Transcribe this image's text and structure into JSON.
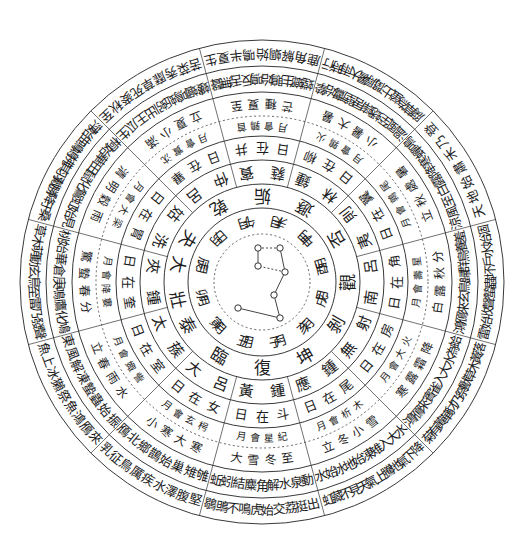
{
  "diagram": {
    "title": "",
    "center": {
      "name": "big-dipper",
      "stars": [
        {
          "x": 258,
          "y": 248
        },
        {
          "x": 280,
          "y": 248
        },
        {
          "x": 285,
          "y": 272
        },
        {
          "x": 258,
          "y": 266
        },
        {
          "x": 274,
          "y": 295
        },
        {
          "x": 280,
          "y": 318
        },
        {
          "x": 238,
          "y": 308
        }
      ]
    },
    "rings": [
      {
        "name": "months",
        "radius": 62,
        "font_size": 13,
        "items": [
          "月子",
          "月丑",
          "月寅",
          "月卯",
          "月辰",
          "月巳",
          "月午",
          "月未",
          "月申",
          "月酉",
          "月戌",
          "月亥"
        ]
      },
      {
        "name": "hexagrams",
        "radius": 86,
        "font_size": 17,
        "items": [
          "復",
          "臨",
          "泰",
          "大壯",
          "夬",
          "乾",
          "姤",
          "遯",
          "否",
          "觀",
          "剝",
          "坤"
        ]
      },
      {
        "name": "pitch-pipes",
        "radius": 110,
        "font_size": 15,
        "items": [
          "黃鍾",
          "大呂",
          "太蔟",
          "夾鍾",
          "姑洗",
          "仲呂",
          "蕤賓",
          "林鍾",
          "夷則",
          "南呂",
          "無射",
          "應鍾"
        ]
      },
      {
        "name": "sun-lodges",
        "radius": 134,
        "font_size": 13,
        "items": [
          "日在斗",
          "日在女",
          "日在室",
          "日在奎",
          "日在胃",
          "日在畢",
          "日在井",
          "日在柳",
          "日在翼",
          "日在角",
          "日在房",
          "日在尾"
        ]
      },
      {
        "name": "lunar-meetings",
        "radius": 156,
        "font_size": 10,
        "items": [
          "月會星紀",
          "月會玄枵",
          "月會娵訾",
          "月會降婁",
          "月會大梁",
          "月會實沈",
          "月會鶉首",
          "月會鶉火",
          "月會鶉尾",
          "月會壽星",
          "月會大火",
          "月會析木"
        ]
      },
      {
        "name": "solar-terms",
        "radius": 178,
        "font_size": 12,
        "items": [
          "大雪 冬至",
          "小寒 大寒",
          "立春 雨水",
          "驚蟄 春分",
          "清明 穀雨",
          "立夏 小滿",
          "芒種 夏至",
          "小暑 大暑",
          "立秋 處暑",
          "白露 秋分",
          "寒露 霜降",
          "立冬 小雪"
        ]
      },
      {
        "name": "phenology-inner",
        "radius": 203,
        "font_size": 13,
        "items": [
          "蚯蚓結 麋角解 水泉動",
          "鴈北鄉 鵲始巢 雉雊",
          "東風解凍 蟄蟲始振",
          "桃始華 倉庚鳴 鷹化鳩",
          "桐始華 田鼠化鴽 虹始見",
          "螻蟈鳴 蚯蚓出 王瓜生",
          "螳螂生 鵙始鳴 反舌無聲",
          "溫風至 蟋蟀居壁 鷹始摯",
          "涼風至 白露降 寒蟬鳴",
          "鴻鴈來 玄鳥歸 群鳥養羞",
          "鴻鴈來賓 雀入大水為蛤",
          "水始冰 地始凍 雉入大水"
        ]
      },
      {
        "name": "phenology-outer",
        "radius": 228,
        "font_size": 13,
        "items": [
          "鶡鴠不鳴 虎始交 荔挺出",
          "乳 征鳥厲疾 水澤腹堅",
          "魚上冰 獺祭魚 鴻鴈來",
          "草木萌動 玄鳥至 雷乃發聲",
          "萍始生 鳴鳩拂其羽 戴勝降于桑",
          "苦菜秀 靡草死 麥秋至",
          "鹿角解 蜩始鳴 半夏生",
          "腐草為螢 土潤溽暑 大雨時行",
          "天地始肅 禾乃登",
          "雷始收聲 蟄蟲坏戶 水始涸",
          "菊有黃華 豺乃祭獸 草木黃落",
          "虹藏不見 天氣上騰 地氣下降"
        ]
      }
    ],
    "colors": {
      "ink": "#1c1c1c",
      "paper": "#ffffff"
    }
  }
}
